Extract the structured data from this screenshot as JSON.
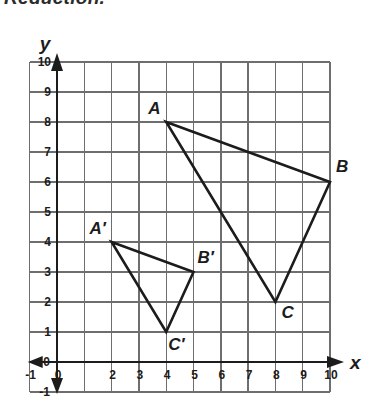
{
  "heading": {
    "text": "Reduction."
  },
  "axes": {
    "x_label": "x",
    "y_label": "y",
    "x_ticks": [
      "-1",
      "0",
      "",
      "2",
      "3",
      "4",
      "5",
      "6",
      "7",
      "8",
      "9",
      "10"
    ],
    "x_tick_values": [
      -1,
      0,
      1,
      2,
      3,
      4,
      5,
      6,
      7,
      8,
      9,
      10
    ],
    "y_ticks": [
      "-1",
      "0",
      "1",
      "2",
      "3",
      "4",
      "5",
      "6",
      "7",
      "8",
      "9",
      "10"
    ],
    "y_tick_values": [
      -1,
      0,
      1,
      2,
      3,
      4,
      5,
      6,
      7,
      8,
      9,
      10
    ],
    "xlim": [
      -1,
      10
    ],
    "ylim": [
      -1,
      10
    ],
    "grid": "on"
  },
  "colors": {
    "grid_line": "#6e6e6e",
    "axis_line": "#1c1c1c",
    "shape_stroke": "#1c1c1c",
    "text": "#1c1c1c",
    "background": "#ffffff"
  },
  "chart_data": {
    "type": "scatter",
    "title": "Reduction.",
    "xlabel": "x",
    "ylabel": "y",
    "xlim": [
      -1,
      10
    ],
    "ylim": [
      -1,
      10
    ],
    "grid": "on",
    "legend": "none",
    "shapes": [
      {
        "name": "triangle-abc",
        "closed": true,
        "vertices": [
          {
            "label": "A",
            "x": 4,
            "y": 8,
            "label_dx": -18,
            "label_dy": -8
          },
          {
            "label": "B",
            "x": 10,
            "y": 6,
            "label_dx": 6,
            "label_dy": -10
          },
          {
            "label": "C",
            "x": 8,
            "y": 2,
            "label_dx": 6,
            "label_dy": 16
          }
        ]
      },
      {
        "name": "triangle-a-prime-b-prime-c-prime",
        "closed": true,
        "vertices": [
          {
            "label": "A′",
            "x": 2,
            "y": 4,
            "label_dx": -22,
            "label_dy": -8
          },
          {
            "label": "B′",
            "x": 5,
            "y": 3,
            "label_dx": 4,
            "label_dy": -9
          },
          {
            "label": "C′",
            "x": 4,
            "y": 1,
            "label_dx": 2,
            "label_dy": 18
          }
        ]
      }
    ]
  }
}
